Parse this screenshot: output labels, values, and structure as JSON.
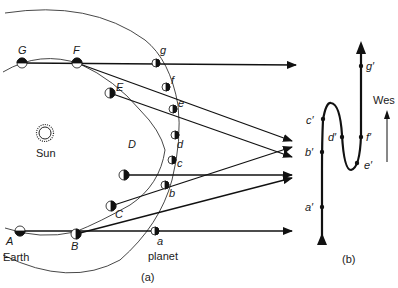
{
  "panel_a": {
    "caption": "(a)",
    "sun_label": "Sun",
    "earth_label": "Earth",
    "planet_label": "planet",
    "earth_positions": [
      "A",
      "B",
      "C",
      "D",
      "E",
      "F",
      "G"
    ],
    "planet_positions": [
      "a",
      "b",
      "c",
      "d",
      "e",
      "f",
      "g"
    ]
  },
  "panel_b": {
    "caption": "(b)",
    "direction_label": "Wes",
    "projected_positions": [
      "a′",
      "b′",
      "c′",
      "d′",
      "e′",
      "f′",
      "g′"
    ]
  },
  "colors": {
    "ink": "#111111",
    "background": "#ffffff"
  }
}
